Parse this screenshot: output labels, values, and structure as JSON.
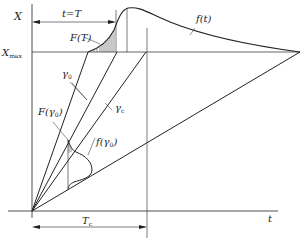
{
  "diagram": {
    "axes": {
      "y_label": "X",
      "x_label": "t",
      "xmax_label": "X",
      "xmax_sub": "max"
    },
    "labels": {
      "t_eq_T": "t=T",
      "F_T": "F(T)",
      "f_t": "f(t)",
      "gamma0": "γ",
      "gamma0_sub": "0",
      "gammac": "γ",
      "gammac_sub": "c",
      "F_gamma0": "F(γ",
      "F_gamma0_sub": "0",
      "F_gamma0_close": ")",
      "f_gamma0": "f(γ",
      "f_gamma0_sub": "0",
      "f_gamma0_close": ")",
      "Tc": "T",
      "Tc_sub": "c"
    },
    "colors": {
      "line": "#222222",
      "background": "#ffffff"
    }
  }
}
